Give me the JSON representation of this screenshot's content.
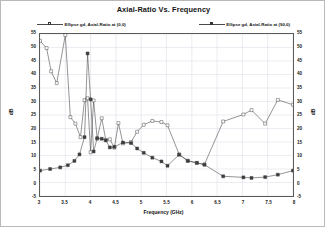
{
  "chart_data": {
    "type": "line",
    "title": "Axial-Ratio Vs. Frequency",
    "xlabel": "Frequency (GHz)",
    "ylabel": "dB",
    "ylabel_right": "dB",
    "xlim": [
      3,
      8
    ],
    "ylim": [
      -5,
      55
    ],
    "xticks": [
      3,
      3.5,
      4,
      4.5,
      5,
      5.5,
      6,
      6.5,
      7,
      7.5,
      8
    ],
    "xtick_labels": [
      "3",
      "3.5",
      "4",
      "4.5",
      "5",
      "5.5",
      "6",
      "6.5",
      "7",
      "7.5",
      "8"
    ],
    "yticks": [
      -5,
      0,
      5,
      10,
      15,
      20,
      25,
      30,
      35,
      40,
      45,
      50,
      55
    ],
    "ytick_labels": [
      "-5",
      "0",
      "5",
      "10",
      "15",
      "20",
      "25",
      "30",
      "35",
      "40",
      "45",
      "50",
      "55"
    ],
    "grid": true,
    "legend_position": "top",
    "series": [
      {
        "name": "Ellipse gd, Axial-Ratio at (0,0)",
        "marker": "square-open",
        "color": "#3d3d3d",
        "points": [
          [
            3.0,
            52.5
          ],
          [
            3.13,
            49.8
          ],
          [
            3.22,
            41.2
          ],
          [
            3.33,
            36.8
          ],
          [
            3.5,
            54.6
          ],
          [
            3.6,
            24.2
          ],
          [
            3.7,
            21.8
          ],
          [
            3.8,
            16.8
          ],
          [
            3.88,
            30.5
          ],
          [
            3.94,
            31.2
          ],
          [
            4.0,
            11.2
          ],
          [
            4.06,
            30.4
          ],
          [
            4.13,
            16.2
          ],
          [
            4.22,
            23.8
          ],
          [
            4.3,
            15.8
          ],
          [
            4.38,
            16.0
          ],
          [
            4.47,
            12.9
          ],
          [
            4.55,
            22.0
          ],
          [
            4.64,
            14.5
          ],
          [
            4.8,
            15.0
          ],
          [
            4.92,
            18.8
          ],
          [
            5.05,
            21.4
          ],
          [
            5.22,
            22.8
          ],
          [
            5.4,
            22.4
          ],
          [
            5.52,
            21.2
          ],
          [
            5.75,
            10.4
          ],
          [
            5.92,
            8.1
          ],
          [
            6.1,
            7.2
          ],
          [
            6.25,
            6.7
          ],
          [
            6.62,
            22.6
          ],
          [
            7.02,
            25.2
          ],
          [
            7.18,
            26.8
          ],
          [
            7.45,
            21.8
          ],
          [
            7.7,
            30.6
          ],
          [
            8.0,
            28.8
          ]
        ]
      },
      {
        "name": "Ellipse gd, Axial-Ratio at (90,0)",
        "marker": "square-filled",
        "color": "#3d3d3d",
        "points": [
          [
            3.0,
            4.4
          ],
          [
            3.2,
            5.0
          ],
          [
            3.4,
            5.6
          ],
          [
            3.55,
            6.4
          ],
          [
            3.68,
            8.0
          ],
          [
            3.78,
            10.4
          ],
          [
            3.88,
            16.8
          ],
          [
            3.94,
            47.8
          ],
          [
            4.0,
            30.8
          ],
          [
            4.06,
            11.5
          ],
          [
            4.13,
            16.4
          ],
          [
            4.22,
            16.2
          ],
          [
            4.3,
            15.6
          ],
          [
            4.38,
            13.0
          ],
          [
            4.47,
            13.2
          ],
          [
            4.64,
            14.8
          ],
          [
            4.8,
            14.6
          ],
          [
            4.92,
            12.6
          ],
          [
            5.05,
            11.0
          ],
          [
            5.22,
            9.2
          ],
          [
            5.4,
            7.8
          ],
          [
            5.52,
            6.2
          ],
          [
            5.75,
            10.3
          ],
          [
            5.92,
            8.0
          ],
          [
            6.1,
            7.3
          ],
          [
            6.25,
            6.6
          ],
          [
            6.62,
            2.3
          ],
          [
            7.02,
            1.9
          ],
          [
            7.18,
            1.7
          ],
          [
            7.45,
            2.0
          ],
          [
            7.7,
            2.9
          ],
          [
            8.0,
            4.4
          ]
        ]
      }
    ]
  }
}
